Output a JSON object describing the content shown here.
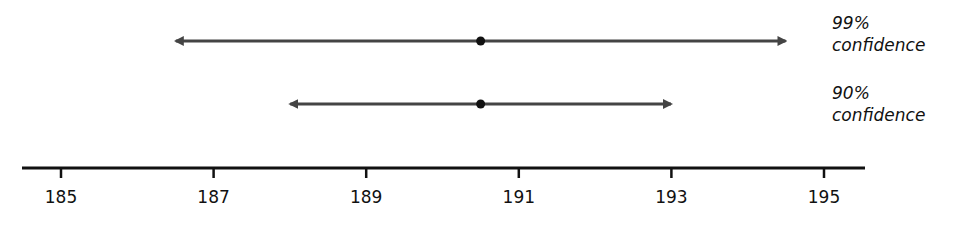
{
  "chart_data": {
    "type": "interval",
    "title": "",
    "xlabel": "",
    "ylabel": "",
    "xlim": [
      184.5,
      195.5
    ],
    "ticks": [
      185,
      187,
      189,
      191,
      193,
      195
    ],
    "tick_labels": [
      "185",
      "187",
      "189",
      "191",
      "193",
      "195"
    ],
    "grid": false,
    "point_estimate": 190.5,
    "series": [
      {
        "name": "99% confidence",
        "level": "99%",
        "lower": 186.4,
        "estimate": 190.5,
        "upper": 194.6
      },
      {
        "name": "90% confidence",
        "level": "90%",
        "lower": 187.9,
        "estimate": 190.5,
        "upper": 193.1
      }
    ],
    "legend_position": "right"
  },
  "labels": {
    "interval_99": {
      "line1": "99%",
      "line2": "confidence"
    },
    "interval_90": {
      "line1": "90%",
      "line2": "confidence"
    }
  },
  "colors": {
    "interval": "#444444",
    "axis": "#111111",
    "background": "#ffffff"
  }
}
